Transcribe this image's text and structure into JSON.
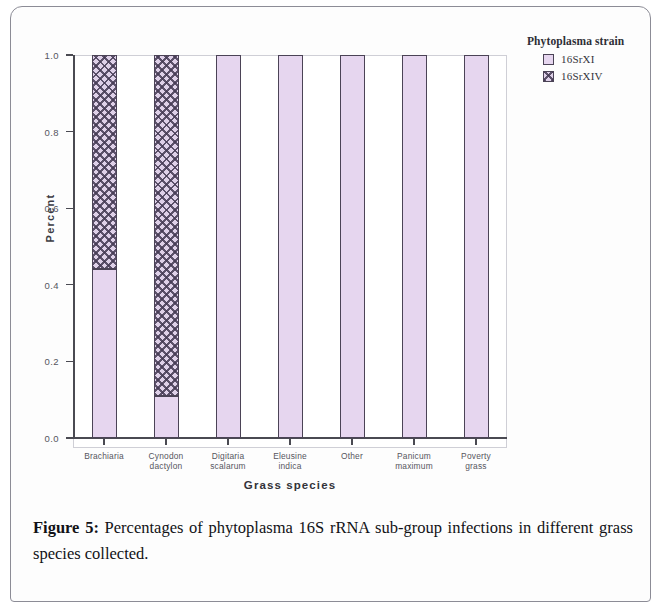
{
  "figure": {
    "caption_label": "Figure 5:",
    "caption_text": "Percentages of phytoplasma 16S rRNA sub-group infections in different grass species collected."
  },
  "legend": {
    "title": "Phytoplasma strain",
    "entries": [
      {
        "label": "16SrXI",
        "color": "#e6d6ef",
        "pattern": "solid"
      },
      {
        "label": "16SrXIV",
        "color": "#ded0e8",
        "pattern": "crosshatch"
      }
    ]
  },
  "axes": {
    "y_title": "Percent",
    "x_title": "Grass species",
    "y_ticks": [
      "1.0",
      "0.8",
      "0.6",
      "0.4",
      "0.2",
      "0.0"
    ]
  },
  "chart_data": {
    "type": "bar",
    "title": "",
    "subtitle": "",
    "xlabel": "Grass species",
    "ylabel": "Percent",
    "ylim": [
      0.0,
      1.0
    ],
    "yticks": [
      0.0,
      0.2,
      0.4,
      0.6,
      0.8,
      1.0
    ],
    "grid": false,
    "stacked": true,
    "legend_title": "Phytoplasma strain",
    "legend_position": "right",
    "categories": [
      "Brachiaria",
      "Cynodon dactylon",
      "Digitaria scalarum",
      "Eleusine indica",
      "Other",
      "Panicum maximum",
      "Poverty grass"
    ],
    "category_lines": [
      [
        "Brachiaria",
        ""
      ],
      [
        "Cynodon",
        "dactylon"
      ],
      [
        "Digitaria",
        "scalarum"
      ],
      [
        "Eleusine",
        "indica"
      ],
      [
        "Other",
        ""
      ],
      [
        "Panicum",
        "maximum"
      ],
      [
        "Poverty",
        "grass"
      ]
    ],
    "series": [
      {
        "name": "16SrXI",
        "color": "#e6d6ef",
        "pattern": "solid",
        "values": [
          0.44,
          0.11,
          1.0,
          1.0,
          1.0,
          1.0,
          1.0
        ]
      },
      {
        "name": "16SrXIV",
        "color": "#ded0e8",
        "pattern": "crosshatch",
        "values": [
          0.56,
          0.89,
          0.0,
          0.0,
          0.0,
          0.0,
          0.0
        ]
      }
    ]
  }
}
